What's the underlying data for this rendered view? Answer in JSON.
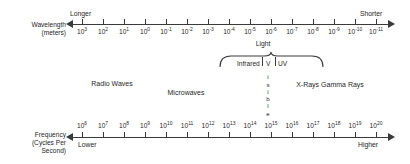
{
  "diagram": {
    "colors": {
      "line": "#3a3a3a",
      "text": "#1f1f1f",
      "background": "#ffffff"
    }
  },
  "wavelength_axis": {
    "name": "Wavelength",
    "label_line1": "Wavelength",
    "label_line2": "(meters)",
    "left_word": "Longer",
    "right_word": "Shorter",
    "unit": "meters",
    "exponents": [
      3,
      2,
      1,
      0,
      -1,
      -2,
      -3,
      -4,
      -5,
      -6,
      -7,
      -8,
      -9,
      -10,
      -11
    ],
    "mantissa": "10"
  },
  "frequency_axis": {
    "name": "Frequency",
    "label_line1": "Frequency",
    "label_line2": "(Cycles Per",
    "label_line3": "Second)",
    "left_word": "Lower",
    "right_word": "Higher",
    "unit": "Cycles Per Second",
    "exponents": [
      6,
      7,
      8,
      9,
      10,
      11,
      12,
      13,
      14,
      15,
      16,
      17,
      18,
      19,
      20
    ],
    "mantissa": "10"
  },
  "bands": [
    {
      "label": "Radio Waves",
      "x": 112,
      "y": 80
    },
    {
      "label": "Microwaves",
      "x": 186,
      "y": 89
    },
    {
      "label": "X-Rays Gamma Rays",
      "x": 330,
      "y": 81
    }
  ],
  "light_group": {
    "title": "Light",
    "segments": [
      {
        "label": "Infrared",
        "x": 237,
        "y": 60
      },
      {
        "label": "V",
        "x": 266,
        "y": 60
      },
      {
        "label": "UV",
        "x": 278,
        "y": 60
      }
    ],
    "visible_word_letters": [
      "V",
      "i",
      "s",
      "i",
      "b",
      "l",
      "e"
    ]
  },
  "chart_data": {
    "type": "table",
    "xlabel": "Wavelength (meters) / Frequency (Cycles Per Second)",
    "ylabel": "",
    "axes": [
      {
        "name": "Wavelength (meters)",
        "direction": "left = Longer, right = Shorter",
        "tick_labels": [
          "10^3",
          "10^2",
          "10^1",
          "10^0",
          "10^-1",
          "10^-2",
          "10^-3",
          "10^-4",
          "10^-5",
          "10^-6",
          "10^-7",
          "10^-8",
          "10^-9",
          "10^-10",
          "10^-11"
        ]
      },
      {
        "name": "Frequency (Cycles Per Second)",
        "direction": "left = Lower, right = Higher",
        "tick_labels": [
          "10^6",
          "10^7",
          "10^8",
          "10^9",
          "10^10",
          "10^11",
          "10^12",
          "10^13",
          "10^14",
          "10^15",
          "10^16",
          "10^17",
          "10^18",
          "10^19",
          "10^20"
        ]
      }
    ],
    "categories": [
      "Radio Waves",
      "Microwaves",
      "Infrared",
      "Visible",
      "UV",
      "X-Rays Gamma Rays"
    ],
    "annotations": [
      "Longer",
      "Shorter",
      "Lower",
      "Higher",
      "Light",
      "Visible"
    ],
    "grid": false,
    "legend": "none"
  }
}
